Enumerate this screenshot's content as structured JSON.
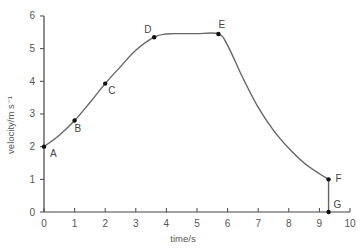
{
  "chart_data": {
    "type": "line",
    "title": "",
    "xlabel": "time/s",
    "ylabel": "velocity/m s⁻¹",
    "xlim": [
      0,
      10
    ],
    "ylim": [
      0,
      6
    ],
    "xticks": [
      "0",
      "1",
      "2",
      "3",
      "4",
      "5",
      "6",
      "7",
      "8",
      "9",
      "10"
    ],
    "yticks": [
      "0",
      "1",
      "2",
      "3",
      "4",
      "5",
      "6"
    ],
    "grid": false,
    "legend": null,
    "points": [
      {
        "label": "A",
        "x": 0,
        "y": 2.0
      },
      {
        "label": "B",
        "x": 1.0,
        "y": 2.8
      },
      {
        "label": "C",
        "x": 2.0,
        "y": 3.93
      },
      {
        "label": "D",
        "x": 3.6,
        "y": 5.35
      },
      {
        "label": "E",
        "x": 5.7,
        "y": 5.45
      },
      {
        "label": "F",
        "x": 9.3,
        "y": 1.0
      },
      {
        "label": "G",
        "x": 9.3,
        "y": 0.0
      }
    ],
    "curve": [
      [
        0,
        2.0
      ],
      [
        0.5,
        2.35
      ],
      [
        1.0,
        2.8
      ],
      [
        1.5,
        3.35
      ],
      [
        2.0,
        3.93
      ],
      [
        2.5,
        4.45
      ],
      [
        3.0,
        4.95
      ],
      [
        3.6,
        5.35
      ],
      [
        4.0,
        5.45
      ],
      [
        4.5,
        5.46
      ],
      [
        5.0,
        5.46
      ],
      [
        5.7,
        5.45
      ],
      [
        6.0,
        5.1
      ],
      [
        6.5,
        4.1
      ],
      [
        7.0,
        3.2
      ],
      [
        7.5,
        2.5
      ],
      [
        8.0,
        1.95
      ],
      [
        8.5,
        1.5
      ],
      [
        9.0,
        1.17
      ],
      [
        9.3,
        1.0
      ],
      [
        9.3,
        0.0
      ]
    ]
  }
}
